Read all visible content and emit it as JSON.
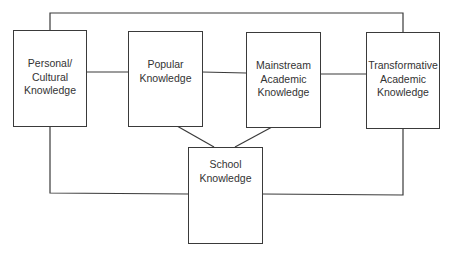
{
  "diagram": {
    "nodes": [
      {
        "id": "personal",
        "label": "Personal/\nCultural\nKnowledge"
      },
      {
        "id": "popular",
        "label": "Popular\nKnowledge"
      },
      {
        "id": "mainstream",
        "label": "Mainstream\nAcademic\nKnowledge"
      },
      {
        "id": "transformative",
        "label": "Transformative\nAcademic\nKnowledge"
      },
      {
        "id": "school",
        "label": "School\nKnowledge"
      }
    ],
    "edges": [
      {
        "from": "personal",
        "to": "popular"
      },
      {
        "from": "popular",
        "to": "mainstream"
      },
      {
        "from": "mainstream",
        "to": "transformative"
      },
      {
        "from": "personal",
        "to": "transformative"
      },
      {
        "from": "popular",
        "to": "school"
      },
      {
        "from": "mainstream",
        "to": "school"
      },
      {
        "from": "personal",
        "to": "school"
      },
      {
        "from": "transformative",
        "to": "school"
      }
    ],
    "line_color": "#3a3a3a"
  }
}
